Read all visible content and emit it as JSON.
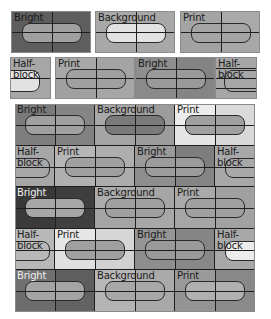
{
  "colors": {
    "line": "#1e1e1e",
    "bright_dark": "#5e5e5e",
    "bright_darker": "#3a3a3a",
    "bright_dark2": "#727272",
    "background_mid": "#a8a8a8",
    "print_mid": "#a4a4a4",
    "half_block": "#a6a6a6",
    "light": "#e6e6e6",
    "pill_mid": "#a0a0a0",
    "pill_dark": "#7a7a7a",
    "pill_light": "#e2e2e2"
  },
  "labels": {
    "bright": "Bright",
    "background": "Background",
    "print": "Print",
    "half_block": "Half-\nblock"
  },
  "legend_row1": [
    {
      "kind": "bright",
      "label": "Bright"
    },
    {
      "kind": "background",
      "label": "Background"
    },
    {
      "kind": "print",
      "label": "Print"
    }
  ],
  "legend_row2": [
    {
      "kind": "half_block",
      "label": "Half-\nblock"
    },
    {
      "kind": "print",
      "label": "Print"
    },
    {
      "kind": "bright",
      "label": "Bright"
    },
    {
      "kind": "half_block",
      "label": "Half-\nblock"
    }
  ],
  "grid_rows": [
    [
      "Bright",
      "Background",
      "Print"
    ],
    [
      "Half-\nblock",
      "Print",
      "Bright",
      "Half-\nblock"
    ],
    [
      "Bright",
      "Background",
      "Print"
    ],
    [
      "Half-\nblock",
      "Print",
      "Bright",
      "Half-\nblock"
    ],
    [
      "Bright",
      "Background",
      "Print"
    ]
  ]
}
